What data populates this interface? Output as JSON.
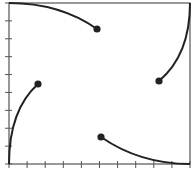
{
  "diagram": {
    "colors": {
      "stroke": "#222222",
      "frame": "#555555",
      "background": "#ffffff"
    },
    "frame": {
      "x1": 9,
      "y1": 3,
      "x2": 190,
      "y2": 164
    },
    "x_ticks": 11,
    "y_ticks": 10,
    "arcs": [
      {
        "name": "top-arc",
        "start": [
          9,
          3
        ],
        "control": [
          60,
          3
        ],
        "end": [
          97,
          29
        ]
      },
      {
        "name": "right-arc",
        "start": [
          190,
          3
        ],
        "control": [
          190,
          55
        ],
        "end": [
          159,
          81
        ]
      },
      {
        "name": "left-arc",
        "start": [
          9,
          164
        ],
        "control": [
          9,
          110
        ],
        "end": [
          38,
          84
        ]
      },
      {
        "name": "bottom-arc",
        "start": [
          190,
          164
        ],
        "control": [
          140,
          164
        ],
        "end": [
          101,
          137
        ]
      }
    ],
    "dots": [
      {
        "name": "dot-top",
        "cx": 97,
        "cy": 29
      },
      {
        "name": "dot-right",
        "cx": 159,
        "cy": 81
      },
      {
        "name": "dot-left",
        "cx": 38,
        "cy": 84
      },
      {
        "name": "dot-bottom",
        "cx": 101,
        "cy": 137
      }
    ]
  }
}
